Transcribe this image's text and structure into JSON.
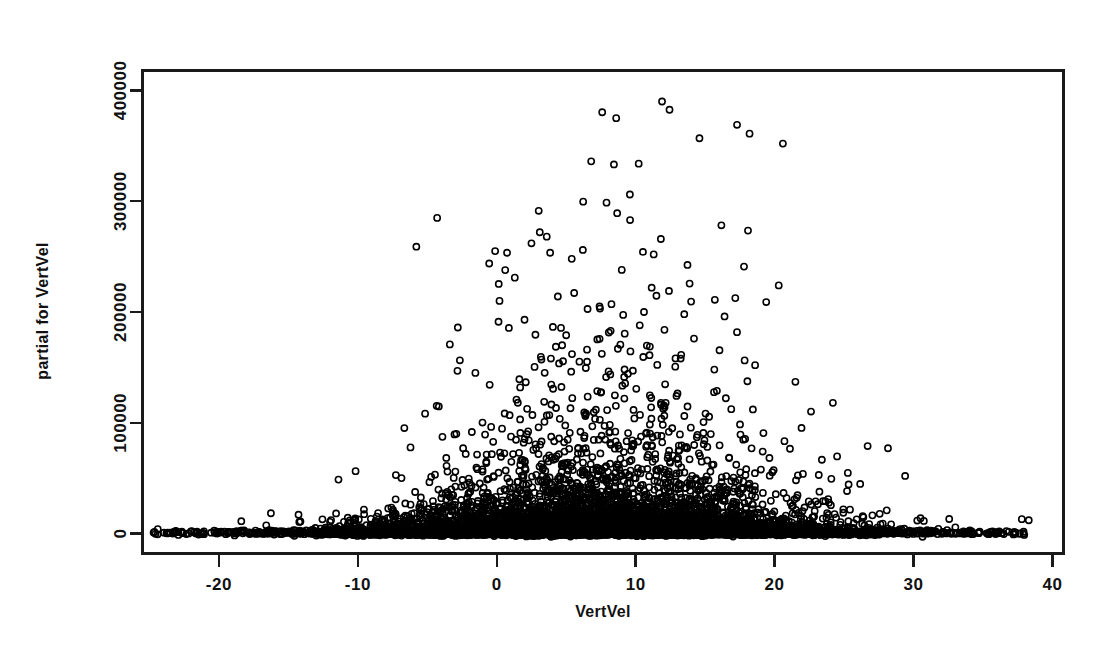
{
  "figure": {
    "background_color": "#ffffff",
    "frame_color": "#1a1a1a",
    "marker_color": "#000000",
    "width": 1116,
    "height": 657
  },
  "chart_data": {
    "type": "scatter",
    "title": "",
    "xlabel": "VertVel",
    "ylabel": "partial for VertVel",
    "xlim": [
      -25.5,
      40.8
    ],
    "ylim": [
      -18000,
      418000
    ],
    "xticks": [
      -20,
      -10,
      0,
      10,
      20,
      30,
      40
    ],
    "xticklabels": [
      "-20",
      "-10",
      "0",
      "10",
      "20",
      "30",
      "40"
    ],
    "yticks": [
      0,
      100000,
      200000,
      300000,
      400000
    ],
    "yticklabels": [
      "0",
      "100000",
      "200000",
      "300000",
      "400000"
    ],
    "grid": false,
    "legend": null,
    "marker": "open-circle",
    "marker_size": 5,
    "n_points_approx": 9000,
    "outlier_points": [
      {
        "x": 11.9,
        "y": 390000
      },
      {
        "x": 8.6,
        "y": 375000
      },
      {
        "x": 17.3,
        "y": 369000
      },
      {
        "x": 18.2,
        "y": 361000
      },
      {
        "x": 20.6,
        "y": 352000
      },
      {
        "x": 6.8,
        "y": 336000
      },
      {
        "x": 9.6,
        "y": 283000
      },
      {
        "x": 3.1,
        "y": 272000
      },
      {
        "x": 3.6,
        "y": 268000
      },
      {
        "x": 2.5,
        "y": 262000
      },
      {
        "x": 6.2,
        "y": 256000
      },
      {
        "x": 11.3,
        "y": 252000
      },
      {
        "x": 5.4,
        "y": 248000
      },
      {
        "x": 17.8,
        "y": 241000
      },
      {
        "x": 9.0,
        "y": 238000
      },
      {
        "x": 1.3,
        "y": 231000
      },
      {
        "x": 20.3,
        "y": 224000
      },
      {
        "x": 12.4,
        "y": 219000
      },
      {
        "x": 4.4,
        "y": 214000
      },
      {
        "x": 15.7,
        "y": 211000
      },
      {
        "x": 19.4,
        "y": 209000
      },
      {
        "x": 7.4,
        "y": 205000
      },
      {
        "x": 0.2,
        "y": 210000
      },
      {
        "x": 10.6,
        "y": 200000
      },
      {
        "x": 13.5,
        "y": 198000
      },
      {
        "x": 16.4,
        "y": 196000
      },
      {
        "x": 2.0,
        "y": 193000
      },
      {
        "x": -2.8,
        "y": 186000
      },
      {
        "x": 8.2,
        "y": 183000
      },
      {
        "x": 5.0,
        "y": 179000
      },
      {
        "x": 14.2,
        "y": 176000
      },
      {
        "x": 6.5,
        "y": 166000
      },
      {
        "x": 11.0,
        "y": 161000
      },
      {
        "x": 3.9,
        "y": 158000
      },
      {
        "x": 18.6,
        "y": 152000
      },
      {
        "x": 9.8,
        "y": 147000
      },
      {
        "x": 21.5,
        "y": 137000
      },
      {
        "x": 24.2,
        "y": 118000
      },
      {
        "x": 26.7,
        "y": 79000
      },
      {
        "x": 29.4,
        "y": 52000
      },
      {
        "x": 37.8,
        "y": 13000
      },
      {
        "x": 38.3,
        "y": 12000
      },
      {
        "x": -24.4,
        "y": 4000
      },
      {
        "x": -23.1,
        "y": 2500
      }
    ],
    "notes": {
      "x_of_peak_spread": 9,
      "dense_band_y_max": 12000,
      "x_range_dense_band": [
        -25,
        36
      ]
    }
  },
  "axes": {
    "x_axis_name": "x-axis",
    "y_axis_name": "y-axis"
  }
}
